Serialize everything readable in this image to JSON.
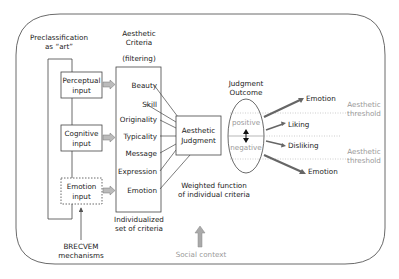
{
  "preclassification": {
    "line1": "Preclassification",
    "line2": "as “art”"
  },
  "criteria_header": {
    "line1": "Aesthetic",
    "line2": "Criteria",
    "line3": "(filtering)"
  },
  "inputs": [
    {
      "line1": "Perceptual",
      "line2": "input"
    },
    {
      "line1": "Cognitive",
      "line2": "input"
    },
    {
      "line1": "Emotion",
      "line2": "input"
    }
  ],
  "criteria": [
    "Beauty",
    "Skill",
    "Originality",
    "Typicality",
    "Message",
    "Expression",
    "Emotion"
  ],
  "criteria_footer": {
    "line1": "Individualized",
    "line2": "set of criteria"
  },
  "brecvem": {
    "line1": "BRECVEM",
    "line2": "mechanisms"
  },
  "judgment": {
    "line1": "Aesthetic",
    "line2": "Judgment"
  },
  "weighted": {
    "line1": "Weighted function",
    "line2": "of individual criteria"
  },
  "outcome": {
    "line1": "Judgment",
    "line2": "Outcome",
    "positive": "positive",
    "negative": "negative"
  },
  "outputs": [
    "Emotion",
    "Liking",
    "Disliking",
    "Emotion"
  ],
  "thresholds": [
    {
      "line1": "Aesthetic",
      "line2": "threshold"
    },
    {
      "line1": "Aesthetic",
      "line2": "threshold"
    }
  ],
  "social_context": "Social context",
  "colors": {
    "line": "#333333",
    "gray_text": "#999999",
    "arrow_fill": "#aaaaaa"
  }
}
